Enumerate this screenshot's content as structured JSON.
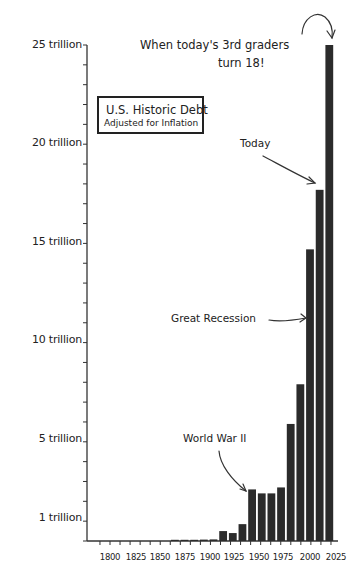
{
  "chart_data": {
    "type": "bar",
    "title": "U.S. Historic Debt",
    "subtitle": "Adjusted for Inflation",
    "xlabel": "",
    "ylabel": "",
    "ylim": [
      0,
      25
    ],
    "y_unit": "trillion USD",
    "grid": false,
    "legend": null,
    "y_ticks": [
      {
        "value": 1,
        "label": "1 trillion"
      },
      {
        "value": 5,
        "label": "5 trillion"
      },
      {
        "value": 10,
        "label": "10 trillion"
      },
      {
        "value": 15,
        "label": "15 trillion"
      },
      {
        "value": 20,
        "label": "20 trillion"
      },
      {
        "value": 25,
        "label": "25 trillion"
      }
    ],
    "x_tick_labels": [
      "1800",
      "1825",
      "1850",
      "1875",
      "1900",
      "1925",
      "1950",
      "1975",
      "2000",
      "2025"
    ],
    "categories": [
      "1870",
      "1880",
      "1890",
      "1900",
      "1910",
      "1920",
      "1930",
      "1940",
      "1950",
      "1960",
      "1970",
      "1980",
      "1990",
      "2000",
      "2010",
      "2020",
      "2030"
    ],
    "values": [
      0.05,
      0.05,
      0.05,
      0.07,
      0.08,
      0.5,
      0.4,
      0.85,
      2.6,
      2.4,
      2.4,
      2.7,
      5.9,
      7.9,
      14.7,
      17.7,
      25.0
    ],
    "annotations": [
      {
        "text": "World War II",
        "points_to": "1950"
      },
      {
        "text": "Great Recession",
        "points_to": "2010"
      },
      {
        "text": "Today",
        "points_to": "2020"
      },
      {
        "text": "When today's 3rd graders turn 18!",
        "points_to": "2030"
      }
    ]
  },
  "labels": {
    "title": "U.S. Historic Debt",
    "subtitle": "Adjusted for Inflation",
    "annot_ww2": "World War II",
    "annot_recession": "Great Recession",
    "annot_today": "Today",
    "annot_future_line1": "When today's 3rd graders",
    "annot_future_line2": "turn 18!",
    "y": [
      "25 trillion",
      "20 trillion",
      "15 trillion",
      "10 trillion",
      "5 trillion",
      "1 trillion"
    ],
    "x": [
      "1800",
      "1825",
      "1850",
      "1875",
      "1900",
      "1925",
      "1950",
      "1975",
      "2000",
      "2025"
    ]
  },
  "colors": {
    "bar": "#2b2b2b",
    "axis": "#333333",
    "text": "#222222",
    "background": "#ffffff"
  }
}
